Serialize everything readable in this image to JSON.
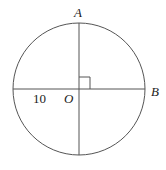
{
  "diagram": {
    "type": "circle-geometry",
    "stroke_color": "#555555",
    "circle": {
      "cx": 79,
      "cy": 89,
      "r": 66
    },
    "labels": {
      "A": "A",
      "B": "B",
      "O": "O",
      "radius_length": "10"
    },
    "right_angle_marker": true
  }
}
